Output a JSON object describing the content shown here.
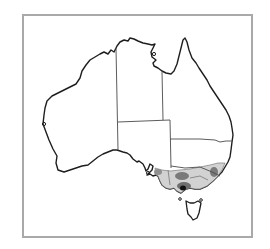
{
  "map": {
    "subject": "Australia distribution map",
    "frame": {
      "x": 22,
      "y": 14,
      "width": 231,
      "height": 224,
      "stroke": "#a9a9a9"
    },
    "colors": {
      "background": "#ffffff",
      "outline": "#1e1e1e",
      "border_lines": "#4a4a4a",
      "range_light": "#d2d2d2",
      "range_medium": "#8f8f8f",
      "range_dark": "#3a3a3a",
      "range_darkest": "#111111"
    },
    "regions": [
      "Western Australia",
      "Northern Territory",
      "Queensland",
      "South Australia",
      "New South Wales",
      "Victoria",
      "Tasmania"
    ],
    "distribution": {
      "description": "Shaded range across south-eastern Australia (south-east South Australia, Victoria, southern New South Wales)",
      "density_levels": [
        "light",
        "medium",
        "dark",
        "darkest"
      ]
    }
  }
}
